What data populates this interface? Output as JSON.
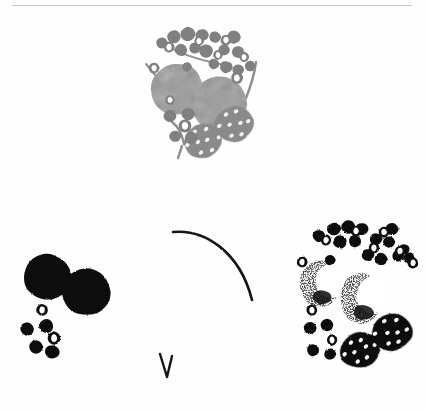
{
  "figure": {
    "background_color": "#fefefe",
    "rule_color": "#c9c9c9",
    "width": 425,
    "height": 411,
    "caption": "",
    "panel_labels": []
  },
  "palette": {
    "berry_gray": "#808080",
    "berry_gray_dark": "#6e6e6e",
    "circle_gray": "#b4b4b4",
    "circle_gray_shade": "#a0a0a0",
    "spotted_gray": "#8a8a8a",
    "spot_fill": "#f2f2f2",
    "stem_gray": "#8f8f8f",
    "black": "#0d0d0d",
    "halftone": "#3a3a3a",
    "outline_white": "#ffffff"
  },
  "panels": [
    {
      "id": "top-grayscale-cluster",
      "name": "grayscale-specimen-cluster",
      "x": 138,
      "y": 26,
      "render_mode": "grayscale",
      "berries": [
        {
          "cx": 24,
          "cy": 17,
          "r": 6.0
        },
        {
          "cx": 36,
          "cy": 11,
          "r": 7.0
        },
        {
          "cx": 50,
          "cy": 8,
          "r": 7.5
        },
        {
          "cx": 64,
          "cy": 9,
          "r": 6.5
        },
        {
          "cx": 77,
          "cy": 11,
          "r": 6.0
        },
        {
          "cx": 96,
          "cy": 11,
          "r": 7.0
        },
        {
          "cx": 43,
          "cy": 24,
          "r": 6.5
        },
        {
          "cx": 57,
          "cy": 22,
          "r": 6.0
        },
        {
          "cx": 68,
          "cy": 25,
          "r": 7.0
        },
        {
          "cx": 86,
          "cy": 24,
          "r": 6.0
        },
        {
          "cx": 100,
          "cy": 26,
          "r": 6.5
        },
        {
          "cx": 76,
          "cy": 38,
          "r": 5.5
        },
        {
          "cx": 88,
          "cy": 41,
          "r": 6.5
        },
        {
          "cx": 100,
          "cy": 44,
          "r": 6.0
        },
        {
          "cx": 112,
          "cy": 40,
          "r": 5.5
        },
        {
          "cx": 49,
          "cy": 41,
          "r": 5.0
        },
        {
          "cx": 32,
          "cy": 90,
          "r": 6.5
        },
        {
          "cx": 50,
          "cy": 88,
          "r": 7.0
        },
        {
          "cx": 37,
          "cy": 110,
          "r": 6.0
        },
        {
          "cx": 53,
          "cy": 112,
          "r": 6.5
        }
      ],
      "rings": [
        {
          "cx": 31,
          "cy": 21,
          "r": 5.5
        },
        {
          "cx": 61,
          "cy": 15,
          "r": 5.0
        },
        {
          "cx": 88,
          "cy": 14,
          "r": 5.5
        },
        {
          "cx": 80,
          "cy": 29,
          "r": 5.0
        },
        {
          "cx": 106,
          "cy": 31,
          "r": 5.0
        },
        {
          "cx": 99,
          "cy": 52,
          "r": 6.0
        },
        {
          "cx": 16,
          "cy": 42,
          "r": 5.5
        },
        {
          "cx": 32,
          "cy": 74,
          "r": 5.0
        },
        {
          "cx": 47,
          "cy": 100,
          "r": 6.5
        }
      ],
      "large_circles": [
        {
          "cx": 39,
          "cy": 63,
          "rx": 27,
          "ry": 26
        },
        {
          "cx": 81,
          "cy": 78,
          "rx": 29,
          "ry": 28
        }
      ],
      "spotted_ovals": [
        {
          "cx": 65,
          "cy": 115,
          "rx": 20,
          "ry": 17,
          "rot": -18,
          "spots": 11
        },
        {
          "cx": 96,
          "cy": 98,
          "rx": 20,
          "ry": 18,
          "rot": -12,
          "spots": 12
        }
      ],
      "stems": [
        {
          "path": "M 18 50 L 8 38",
          "w": 2
        },
        {
          "path": "M 118 36 C 116 52 112 62 108 72",
          "w": 2.4
        },
        {
          "path": "M 30 20 C 45 30 70 36 92 40",
          "w": 2
        },
        {
          "path": "M 46 118 C 44 108 40 100 34 96",
          "w": 2.4
        },
        {
          "path": "M 46 118 C 50 110 52 104 52 98",
          "w": 2.2
        },
        {
          "path": "M 44 120 L 40 132",
          "w": 2.4
        }
      ]
    },
    {
      "id": "bottom-left-black-cluster",
      "name": "high-contrast-black-cluster",
      "x": 14,
      "y": 252,
      "render_mode": "threshold-black",
      "berries": [
        {
          "cx": 13,
          "cy": 77,
          "r": 7.0
        },
        {
          "cx": 32,
          "cy": 74,
          "r": 7.5
        },
        {
          "cx": 22,
          "cy": 95,
          "r": 7.0
        },
        {
          "cx": 38,
          "cy": 100,
          "r": 7.5
        }
      ],
      "rings": [
        {
          "cx": 28,
          "cy": 58,
          "r": 6.0
        },
        {
          "cx": 40,
          "cy": 86,
          "r": 6.5
        }
      ],
      "large_circles": [
        {
          "cx": 33,
          "cy": 25,
          "rx": 24,
          "ry": 23
        },
        {
          "cx": 72,
          "cy": 40,
          "rx": 25,
          "ry": 24
        }
      ],
      "spotted_ovals": [],
      "stems": []
    },
    {
      "id": "bottom-right-halftone-cluster",
      "name": "halftone-specimen-cluster",
      "x": 288,
      "y": 218,
      "render_mode": "threshold-halftone",
      "berries": [
        {
          "cx": 31,
          "cy": 18,
          "r": 6.5
        },
        {
          "cx": 46,
          "cy": 11,
          "r": 7.0
        },
        {
          "cx": 60,
          "cy": 9,
          "r": 7.0
        },
        {
          "cx": 74,
          "cy": 11,
          "r": 6.5
        },
        {
          "cx": 104,
          "cy": 11,
          "r": 6.5
        },
        {
          "cx": 52,
          "cy": 24,
          "r": 7.0
        },
        {
          "cx": 67,
          "cy": 23,
          "r": 6.5
        },
        {
          "cx": 88,
          "cy": 21,
          "r": 6.5
        },
        {
          "cx": 101,
          "cy": 24,
          "r": 6.0
        },
        {
          "cx": 80,
          "cy": 37,
          "r": 6.5
        },
        {
          "cx": 93,
          "cy": 41,
          "r": 6.5
        },
        {
          "cx": 110,
          "cy": 38,
          "r": 6.0
        },
        {
          "cx": 121,
          "cy": 40,
          "r": 6.0
        },
        {
          "cx": 42,
          "cy": 42,
          "r": 5.5
        },
        {
          "cx": 22,
          "cy": 110,
          "r": 6.5
        },
        {
          "cx": 39,
          "cy": 107,
          "r": 6.5
        },
        {
          "cx": 25,
          "cy": 132,
          "r": 6.5
        },
        {
          "cx": 42,
          "cy": 136,
          "r": 6.0
        },
        {
          "cx": 116,
          "cy": 31,
          "r": 5.5
        }
      ],
      "rings": [
        {
          "cx": 38,
          "cy": 22,
          "r": 5.5
        },
        {
          "cx": 68,
          "cy": 13,
          "r": 5.5
        },
        {
          "cx": 96,
          "cy": 14,
          "r": 5.5
        },
        {
          "cx": 86,
          "cy": 30,
          "r": 5.5
        },
        {
          "cx": 112,
          "cy": 33,
          "r": 5.5
        },
        {
          "cx": 125,
          "cy": 45,
          "r": 5.5
        },
        {
          "cx": 14,
          "cy": 44,
          "r": 5.5
        },
        {
          "cx": 24,
          "cy": 92,
          "r": 5.5
        },
        {
          "cx": 44,
          "cy": 122,
          "r": 5.5
        }
      ],
      "large_circles": [
        {
          "cx": 32,
          "cy": 66,
          "rx": 20,
          "ry": 24
        },
        {
          "cx": 73,
          "cy": 80,
          "rx": 21,
          "ry": 26
        }
      ],
      "spotted_ovals": [
        {
          "cx": 72,
          "cy": 132,
          "rx": 21,
          "ry": 18,
          "rot": -20,
          "spots": 11
        },
        {
          "cx": 104,
          "cy": 114,
          "rx": 21,
          "ry": 19,
          "rot": -10,
          "spots": 12
        }
      ],
      "stems": []
    }
  ],
  "annotations": {
    "arc": {
      "name": "curved-stem-mark",
      "path": "M 173 232 C 205 229 240 252 252 300",
      "stroke": "#141414",
      "width": 2.6
    },
    "vmark": {
      "name": "v-tick-mark",
      "path": "M 160 354 L 167 377 L 172 356",
      "stroke": "#141414",
      "width": 2.4
    }
  }
}
